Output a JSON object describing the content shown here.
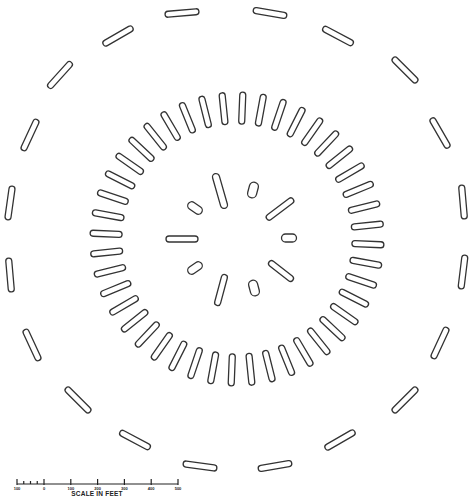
{
  "figure": {
    "title": "",
    "center": [
      237,
      239
    ],
    "stroke_color": "#333333",
    "background_color": "#ffffff"
  },
  "rings": {
    "inner": {
      "count": 10,
      "features": [
        {
          "cx": 220,
          "cy": 191,
          "length": 36,
          "width": 7,
          "angle": 74
        },
        {
          "cx": 253,
          "cy": 190,
          "length": 16,
          "width": 9,
          "angle": 105
        },
        {
          "cx": 280,
          "cy": 209,
          "length": 33,
          "width": 6,
          "angle": -37
        },
        {
          "cx": 289,
          "cy": 238,
          "length": 15,
          "width": 8,
          "angle": 0
        },
        {
          "cx": 281,
          "cy": 271,
          "length": 30,
          "width": 6,
          "angle": 38
        },
        {
          "cx": 254,
          "cy": 288,
          "length": 16,
          "width": 9,
          "angle": 75
        },
        {
          "cx": 221,
          "cy": 290,
          "length": 32,
          "width": 6,
          "angle": 105
        },
        {
          "cx": 195,
          "cy": 268,
          "length": 16,
          "width": 8,
          "angle": -35
        },
        {
          "cx": 182,
          "cy": 239,
          "length": 32,
          "width": 6,
          "angle": 0
        },
        {
          "cx": 195,
          "cy": 208,
          "length": 16,
          "width": 8,
          "angle": 35
        }
      ]
    },
    "middle": {
      "count": 44,
      "radius": 131,
      "slit_length": 32,
      "slit_width": 6,
      "orientation": "radial"
    },
    "outer": {
      "count": 20,
      "features": [
        {
          "cx": 182,
          "cy": 13,
          "angle": -5
        },
        {
          "cx": 270,
          "cy": 13,
          "angle": 10
        },
        {
          "cx": 338,
          "cy": 36,
          "angle": 28
        },
        {
          "cx": 405,
          "cy": 70,
          "angle": 45
        },
        {
          "cx": 440,
          "cy": 133,
          "angle": 60
        },
        {
          "cx": 463,
          "cy": 202,
          "angle": 85
        },
        {
          "cx": 463,
          "cy": 272,
          "angle": 97
        },
        {
          "cx": 440,
          "cy": 343,
          "angle": 115
        },
        {
          "cx": 405,
          "cy": 400,
          "angle": 135
        },
        {
          "cx": 340,
          "cy": 440,
          "angle": 150
        },
        {
          "cx": 275,
          "cy": 466,
          "angle": 170
        },
        {
          "cx": 200,
          "cy": 466,
          "angle": 188
        },
        {
          "cx": 135,
          "cy": 440,
          "angle": 208
        },
        {
          "cx": 78,
          "cy": 400,
          "angle": 225
        },
        {
          "cx": 32,
          "cy": 345,
          "angle": 245
        },
        {
          "cx": 10,
          "cy": 275,
          "angle": 265
        },
        {
          "cx": 10,
          "cy": 203,
          "angle": 278
        },
        {
          "cx": 30,
          "cy": 135,
          "angle": 295
        },
        {
          "cx": 60,
          "cy": 75,
          "angle": 312
        },
        {
          "cx": 118,
          "cy": 36,
          "angle": 330
        }
      ],
      "slit_length": 34,
      "slit_width": 6,
      "orientation": "tangential"
    }
  },
  "scale_bar": {
    "title": "SCALE IN FEET",
    "labels": [
      "100",
      "0",
      "100",
      "200",
      "300",
      "400",
      "500"
    ],
    "x_start": 17,
    "x_zero": 44,
    "x_end": 178,
    "y": 484,
    "minor_subdivisions": 4
  }
}
